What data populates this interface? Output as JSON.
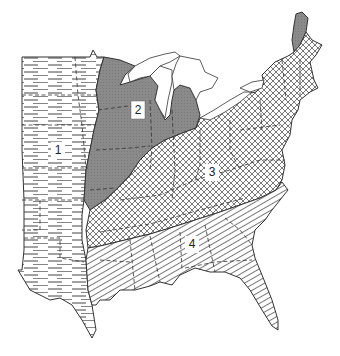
{
  "map": {
    "title": "Eastern United States regions",
    "regions": [
      {
        "id": 1,
        "label": "1",
        "pattern": "horizontal-streaks",
        "fill": "#ffffff",
        "x": 58,
        "y": 150
      },
      {
        "id": 2,
        "label": "2",
        "pattern": "solid-gray",
        "fill": "#8a8a8a",
        "x": 138,
        "y": 110
      },
      {
        "id": 3,
        "label": "3",
        "pattern": "cross-hatch",
        "fill": "#ffffff",
        "x": 212,
        "y": 172
      },
      {
        "id": 4,
        "label": "4",
        "pattern": "diagonal-lines",
        "fill": "#ffffff",
        "x": 192,
        "y": 244
      }
    ],
    "colors": {
      "outline": "#333333",
      "region2": "#8a8a8a",
      "water": "#ffffff",
      "background": "#ffffff"
    }
  }
}
